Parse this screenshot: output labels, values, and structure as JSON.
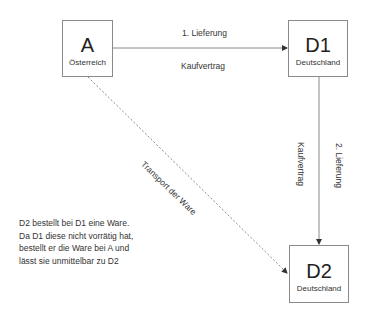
{
  "nodes": {
    "a": {
      "title": "A",
      "subtitle": "Österreich"
    },
    "d1": {
      "title": "D1",
      "subtitle": "Deutschland"
    },
    "d2": {
      "title": "D2",
      "subtitle": "Deutschland"
    }
  },
  "edges": {
    "a_to_d1": {
      "label_top": "1. Lieferung",
      "label_bottom": "Kaufvertrag",
      "style": "solid"
    },
    "d1_to_d2": {
      "label_left": "Kaufvertrag",
      "label_right": "2. Lieferung",
      "style": "solid"
    },
    "a_to_d2": {
      "label": "Transport der Ware",
      "style": "dashed"
    }
  },
  "note": {
    "lines": [
      "D2 bestellt bei D1 eine Ware.",
      "Da D1 diese nicht vorrätig hat,",
      "bestellt er die Ware bei A und",
      "lässt sie unmittelbar zu D2"
    ]
  },
  "colors": {
    "line": "#8a8a8a",
    "arrowhead": "#333333",
    "text": "#222222"
  }
}
